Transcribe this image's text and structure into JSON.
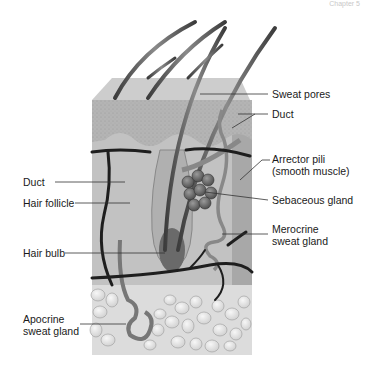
{
  "header": {
    "text": "Chapter 5"
  },
  "diagram": {
    "colors": {
      "top_face": "#c9c9c9",
      "epidermis": "#aaaaaa",
      "dermis": "#bdbdbd",
      "vessel": "#1e1e1e",
      "fat": "#e6e6e6",
      "gland": "#6e6e6e",
      "hair": "#5a5a5a",
      "leader": "#333333"
    },
    "labels_right": [
      {
        "id": "sweat-pores",
        "text": "Sweat pores"
      },
      {
        "id": "duct-right",
        "text": "Duct"
      },
      {
        "id": "arrector-pili",
        "line1": "Arrector pili",
        "line2": "(smooth muscle)"
      },
      {
        "id": "sebaceous-gland",
        "text": "Sebaceous gland"
      },
      {
        "id": "merocrine",
        "line1": "Merocrine",
        "line2": "sweat gland"
      }
    ],
    "labels_left": [
      {
        "id": "duct-left",
        "text": "Duct"
      },
      {
        "id": "hair-follicle",
        "text": "Hair follicle"
      },
      {
        "id": "hair-bulb",
        "text": "Hair bulb"
      },
      {
        "id": "apocrine",
        "line1": "Apocrine",
        "line2": "sweat gland"
      }
    ]
  }
}
